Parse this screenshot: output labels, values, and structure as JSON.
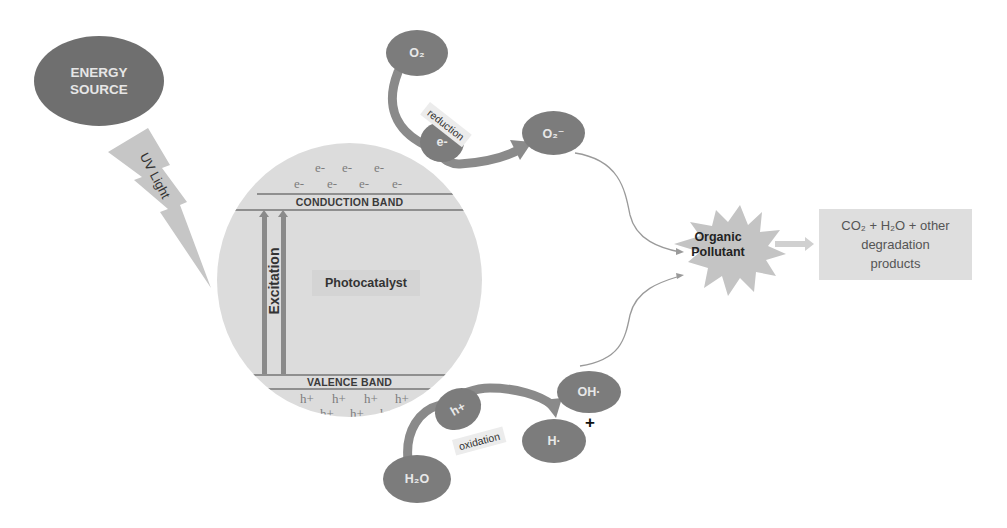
{
  "energy_source": {
    "line1": "ENERGY",
    "line2": "SOURCE"
  },
  "uv_light": {
    "label": "UV Light"
  },
  "photocatalyst": {
    "conduction_band_label": "CONDUCTION BAND",
    "valence_band_label": "VALENCE BAND",
    "center_label": "Photocatalyst",
    "excitation_label": "Excitation",
    "electrons": [
      "e-",
      "e-",
      "e-",
      "e-",
      "e-",
      "e-",
      "e-"
    ],
    "holes": [
      "h+",
      "h+",
      "h+",
      "h+",
      "h+",
      "h+",
      "h+"
    ]
  },
  "reduction": {
    "reactant": "O₂",
    "carrier": "e-",
    "label": "reduction",
    "product": "O₂⁻"
  },
  "oxidation": {
    "reactant": "H₂O",
    "carrier": "h+",
    "label": "oxidation",
    "product_1": "OH·",
    "product_2": "H·",
    "plus_symbol": "+"
  },
  "pollutant": {
    "line1": "Organic",
    "line2": "Pollutant"
  },
  "products": {
    "line1": "CO₂ + H₂O + other",
    "line2": "degradation",
    "line3": "products"
  },
  "colors": {
    "dark_ellipse": "#6f6f6f",
    "molecule": "#7c7c7c",
    "circle_fill": "#dcdcdc",
    "star_fill": "#c4c4c4",
    "box_fill": "#dedede"
  }
}
